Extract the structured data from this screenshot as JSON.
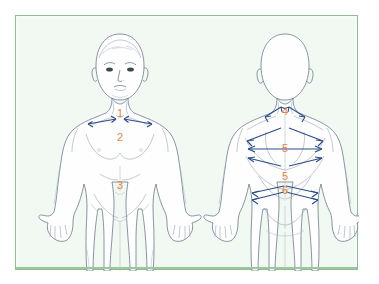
{
  "figure": {
    "panel": {
      "background_color": "#f2f8f2",
      "border_color": "#8cbf94"
    },
    "colors": {
      "label": "#e8833a",
      "arrow": "#2b4c8c",
      "outline": "#6b7b8c",
      "page_background": "#ffffff"
    },
    "views": [
      {
        "name": "anterior-view",
        "label": "front",
        "markers": [
          {
            "id": "1",
            "text": "1",
            "region": "neck-clavicle",
            "arrows": "double-inward-horizontal"
          },
          {
            "id": "2",
            "text": "2",
            "region": "chest",
            "arrows": "none"
          },
          {
            "id": "3",
            "text": "3",
            "region": "abdomen",
            "arrows": "none"
          }
        ]
      },
      {
        "name": "posterior-view",
        "label": "back",
        "markers": [
          {
            "id": "4",
            "text": "4",
            "region": "neck-trapezius",
            "arrows": "double-outward-diagonal"
          },
          {
            "id": "5a",
            "text": "5",
            "region": "upper-back",
            "arrows": "double-horizontal-and-diagonal"
          },
          {
            "id": "5b",
            "text": "5",
            "region": "mid-back",
            "arrows": "curved-span"
          },
          {
            "id": "6",
            "text": "6",
            "region": "waist",
            "arrows": "double-converging"
          }
        ]
      }
    ]
  }
}
